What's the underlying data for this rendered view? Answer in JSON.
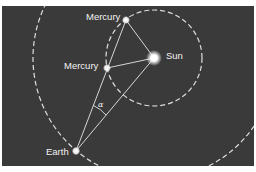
{
  "diagram": {
    "background_color": "#3a3a3a",
    "line_color": "#e8e8e8",
    "labels": {
      "mercury_top": "Mercury",
      "mercury_mid": "Mercury",
      "sun": "Sun",
      "earth": "Earth",
      "angle": "α"
    },
    "bodies": [
      {
        "name": "Sun",
        "x": 154,
        "y": 58
      },
      {
        "name": "Mercury (greatest elongation)",
        "x": 126,
        "y": 20
      },
      {
        "name": "Mercury",
        "x": 107,
        "y": 68
      },
      {
        "name": "Earth",
        "x": 76,
        "y": 151
      }
    ],
    "orbits": [
      {
        "name": "Mercury orbit",
        "center": [
          154,
          58
        ],
        "radius": 48,
        "style": "dashed"
      },
      {
        "name": "Earth orbit",
        "center": [
          154,
          58
        ],
        "radius": 121,
        "style": "dashed"
      }
    ]
  }
}
